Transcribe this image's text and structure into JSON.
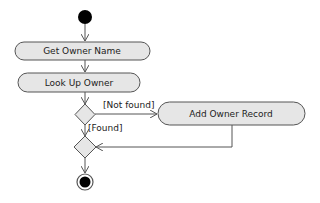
{
  "diagram": {
    "type": "uml-activity",
    "colors": {
      "node_fill": "#e6e6e6",
      "node_stroke": "#555555",
      "edge": "#555555",
      "start_fill": "#000000",
      "text": "#222222"
    },
    "nodes": {
      "start": {
        "kind": "initial"
      },
      "get_owner_name": {
        "kind": "action",
        "label": "Get Owner Name"
      },
      "look_up_owner": {
        "kind": "action",
        "label": "Look Up Owner"
      },
      "decision": {
        "kind": "decision"
      },
      "add_owner_record": {
        "kind": "action",
        "label": "Add Owner Record"
      },
      "merge": {
        "kind": "merge"
      },
      "end": {
        "kind": "final"
      }
    },
    "edges": {
      "not_found": {
        "from": "decision",
        "to": "add_owner_record",
        "guard": "[Not found]"
      },
      "found": {
        "from": "decision",
        "to": "merge",
        "guard": "[Found]"
      }
    }
  }
}
